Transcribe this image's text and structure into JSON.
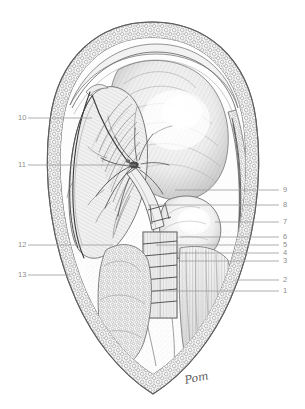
{
  "plate": {
    "title": "Anatomical dissection plate",
    "description": "Grayscale pen-and-ink anatomical dissection of a pointed-oval surgical field with numbered leader lines",
    "background_color": "#ffffff",
    "ink_color": "#555555",
    "label_color": "#8d8d8d",
    "leader_color": "#9a9a9a"
  },
  "signature": {
    "text": "Pom"
  },
  "labels": {
    "left": [
      {
        "number": "10",
        "text_x": 18,
        "text_y": 114,
        "line_x1": 28,
        "line_x2": 92,
        "line_y": 118
      },
      {
        "number": "11",
        "text_x": 18,
        "text_y": 161,
        "line_x1": 28,
        "line_x2": 136,
        "line_y": 165
      },
      {
        "number": "12",
        "text_x": 18,
        "text_y": 241,
        "line_x1": 28,
        "line_x2": 113,
        "line_y": 245
      },
      {
        "number": "13",
        "text_x": 18,
        "text_y": 271,
        "line_x1": 28,
        "line_x2": 70,
        "line_y": 275
      }
    ],
    "right": [
      {
        "number": "9",
        "text_x": 283,
        "text_y": 186,
        "line_x1": 175,
        "line_x2": 279,
        "line_y": 190
      },
      {
        "number": "8",
        "text_x": 283,
        "text_y": 201,
        "line_x1": 148,
        "line_x2": 279,
        "line_y": 205
      },
      {
        "number": "7",
        "text_x": 283,
        "text_y": 218,
        "line_x1": 215,
        "line_x2": 279,
        "line_y": 222
      },
      {
        "number": "6",
        "text_x": 283,
        "text_y": 233,
        "line_x1": 180,
        "line_x2": 279,
        "line_y": 237
      },
      {
        "number": "5",
        "text_x": 283,
        "text_y": 241,
        "line_x1": 156,
        "line_x2": 279,
        "line_y": 245
      },
      {
        "number": "4",
        "text_x": 283,
        "text_y": 249,
        "line_x1": 170,
        "line_x2": 279,
        "line_y": 253
      },
      {
        "number": "3",
        "text_x": 283,
        "text_y": 257,
        "line_x1": 176,
        "line_x2": 279,
        "line_y": 261
      },
      {
        "number": "2",
        "text_x": 283,
        "text_y": 276,
        "line_x1": 235,
        "line_x2": 279,
        "line_y": 280
      },
      {
        "number": "1",
        "text_x": 283,
        "text_y": 287,
        "line_x1": 155,
        "line_x2": 279,
        "line_y": 291
      }
    ]
  }
}
